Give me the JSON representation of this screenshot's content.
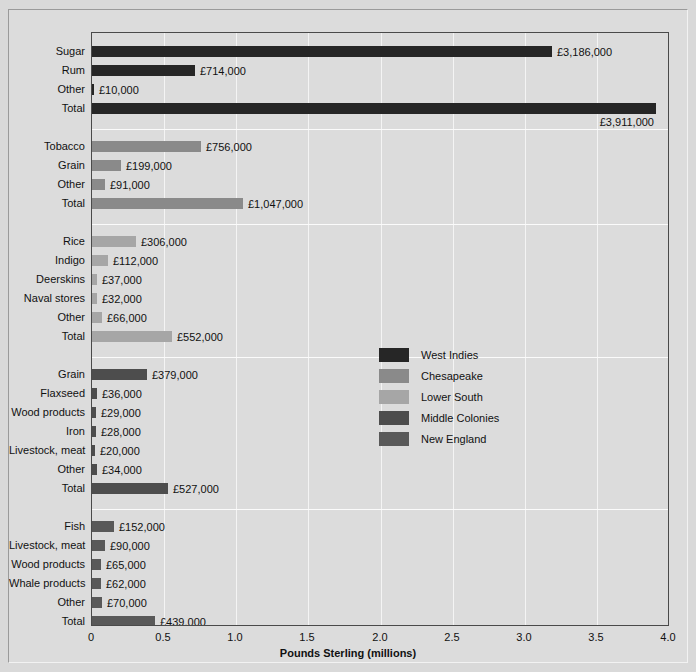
{
  "chart_data": {
    "type": "bar",
    "orientation": "horizontal",
    "title": "",
    "xlabel": "Pounds Sterling (millions)",
    "ylabel": "",
    "xlim": [
      0,
      4.0
    ],
    "xticks": [
      "0",
      "0.5",
      "1.0",
      "1.5",
      "2.0",
      "2.5",
      "3.0",
      "3.5",
      "4.0"
    ],
    "xtick_values": [
      0,
      0.5,
      1.0,
      1.5,
      2.0,
      2.5,
      3.0,
      3.5,
      4.0
    ],
    "grid": true,
    "legend_position": "center-right",
    "units": "Pounds Sterling (millions)",
    "groups": [
      {
        "name": "West Indies",
        "color": "#262626",
        "bars": [
          {
            "label": "Sugar",
            "value": 3.186,
            "value_label": "£3,186,000",
            "label_below": false
          },
          {
            "label": "Rum",
            "value": 0.714,
            "value_label": "£714,000",
            "label_below": false
          },
          {
            "label": "Other",
            "value": 0.01,
            "value_label": "£10,000",
            "label_below": false
          },
          {
            "label": "Total",
            "value": 3.911,
            "value_label": "£3,911,000",
            "label_below": true
          }
        ]
      },
      {
        "name": "Chesapeake",
        "color": "#8a8a8a",
        "bars": [
          {
            "label": "Tobacco",
            "value": 0.756,
            "value_label": "£756,000",
            "label_below": false
          },
          {
            "label": "Grain",
            "value": 0.199,
            "value_label": "£199,000",
            "label_below": false
          },
          {
            "label": "Other",
            "value": 0.091,
            "value_label": "£91,000",
            "label_below": false
          },
          {
            "label": "Total",
            "value": 1.047,
            "value_label": "£1,047,000",
            "label_below": false
          }
        ]
      },
      {
        "name": "Lower South",
        "color": "#a6a6a6",
        "bars": [
          {
            "label": "Rice",
            "value": 0.306,
            "value_label": "£306,000",
            "label_below": false
          },
          {
            "label": "Indigo",
            "value": 0.112,
            "value_label": "£112,000",
            "label_below": false
          },
          {
            "label": "Deerskins",
            "value": 0.037,
            "value_label": "£37,000",
            "label_below": false
          },
          {
            "label": "Naval stores",
            "value": 0.032,
            "value_label": "£32,000",
            "label_below": false
          },
          {
            "label": "Other",
            "value": 0.066,
            "value_label": "£66,000",
            "label_below": false
          },
          {
            "label": "Total",
            "value": 0.552,
            "value_label": "£552,000",
            "label_below": false
          }
        ]
      },
      {
        "name": "Middle Colonies",
        "color": "#4d4d4d",
        "bars": [
          {
            "label": "Grain",
            "value": 0.379,
            "value_label": "£379,000",
            "label_below": false
          },
          {
            "label": "Flaxseed",
            "value": 0.036,
            "value_label": "£36,000",
            "label_below": false
          },
          {
            "label": "Wood products",
            "value": 0.029,
            "value_label": "£29,000",
            "label_below": false
          },
          {
            "label": "Iron",
            "value": 0.028,
            "value_label": "£28,000",
            "label_below": false
          },
          {
            "label": "Livestock, meat",
            "value": 0.02,
            "value_label": "£20,000",
            "label_below": false
          },
          {
            "label": "Other",
            "value": 0.034,
            "value_label": "£34,000",
            "label_below": false
          },
          {
            "label": "Total",
            "value": 0.527,
            "value_label": "£527,000",
            "label_below": false
          }
        ]
      },
      {
        "name": "New England",
        "color": "#595959",
        "bars": [
          {
            "label": "Fish",
            "value": 0.152,
            "value_label": "£152,000",
            "label_below": false
          },
          {
            "label": "Livestock, meat",
            "value": 0.09,
            "value_label": "£90,000",
            "label_below": false
          },
          {
            "label": "Wood products",
            "value": 0.065,
            "value_label": "£65,000",
            "label_below": false
          },
          {
            "label": "Whale products",
            "value": 0.062,
            "value_label": "£62,000",
            "label_below": false
          },
          {
            "label": "Other",
            "value": 0.07,
            "value_label": "£70,000",
            "label_below": false
          },
          {
            "label": "Total",
            "value": 0.439,
            "value_label": "£439,000",
            "label_below": false
          }
        ]
      }
    ],
    "legend": [
      {
        "label": "West Indies",
        "color": "#262626"
      },
      {
        "label": "Chesapeake",
        "color": "#8a8a8a"
      },
      {
        "label": "Lower South",
        "color": "#a6a6a6"
      },
      {
        "label": "Middle Colonies",
        "color": "#4d4d4d"
      },
      {
        "label": "New England",
        "color": "#595959"
      }
    ]
  }
}
